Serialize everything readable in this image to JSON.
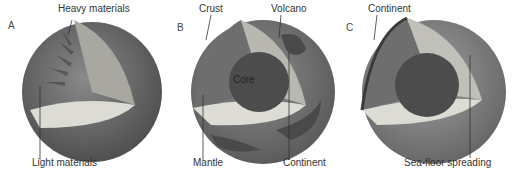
{
  "figure": {
    "panels": [
      {
        "letter": "A",
        "labels": {
          "top": "Heavy materials",
          "bottom": "Light materials"
        }
      },
      {
        "letter": "B",
        "labels": {
          "top_left": "Crust",
          "top_right": "Volcano",
          "center": "Core",
          "bottom_left": "Mantle",
          "bottom_right": "Continent"
        }
      },
      {
        "letter": "C",
        "labels": {
          "top": "Continent",
          "bottom": "Sea-floor spreading"
        }
      }
    ],
    "colors": {
      "sphere_dark": "#5a5a5a",
      "sphere_mid": "#7a7a7a",
      "cut_light": "#d8d8d0",
      "core": "#4a4a4a",
      "label": "#333333"
    }
  }
}
